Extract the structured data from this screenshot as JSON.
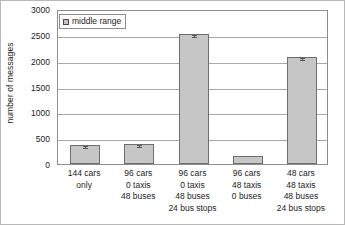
{
  "chart_data": {
    "type": "bar",
    "title": "",
    "xlabel": "",
    "ylabel": "number of messages",
    "ylim": [
      0,
      3000
    ],
    "ytick_values": [
      0,
      500,
      1000,
      1500,
      2000,
      2500,
      3000
    ],
    "ytick_labels": [
      "0",
      "500",
      "1000",
      "1500",
      "2000",
      "2500",
      "3000"
    ],
    "grid": true,
    "legend_position": "top-left",
    "legend": [
      "middle range"
    ],
    "series": [
      {
        "name": "middle range",
        "values": [
          370,
          385,
          2520,
          150,
          2070
        ],
        "errors": [
          18,
          18,
          22,
          0,
          22
        ],
        "color": "#c6c6c6"
      }
    ],
    "categories": [
      "144 cars only",
      "96 cars 0 taxis 48 buses",
      "96 cars 0 taxis 48 buses 24 bus stops",
      "96 cars 48 taxis 0 buses",
      "48 cars 48 taxis 48 buses 24 bus stops"
    ],
    "category_lines": [
      [
        "144 cars",
        "only"
      ],
      [
        "96 cars",
        "0 taxis",
        "48 buses"
      ],
      [
        "96 cars",
        "0 taxis",
        "48 buses",
        "24 bus stops"
      ],
      [
        "96 cars",
        "48 taxis",
        "0 buses"
      ],
      [
        "48 cars",
        "48 taxis",
        "48 buses",
        "24 bus stops"
      ]
    ]
  }
}
